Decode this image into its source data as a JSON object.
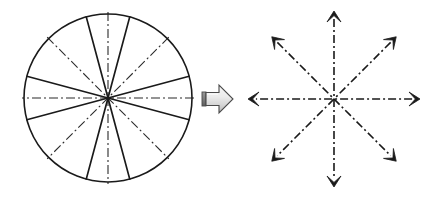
{
  "figure": {
    "caption": "",
    "width": 435,
    "height": 197,
    "background_color": "#ffffff"
  },
  "colors": {
    "stroke": "#1a1a1a",
    "circle_outline": "#1a1a1a",
    "solid_spoke": "#1a1a1a",
    "dashdot_axis": "#2b2b2b",
    "arrow_fill_light": "#efefef",
    "arrow_fill_mid": "#d0d0d0",
    "arrow_fill_dark": "#8a8a8a",
    "arrow_outline": "#4a4a4a",
    "arrow_cap": "#6e6e6e",
    "background": "#ffffff"
  },
  "left_panel": {
    "name": "sectored-circle",
    "label": "",
    "center": {
      "x": 108,
      "y": 98
    },
    "radius": 84,
    "sector_count": 12,
    "outline_width": 1.6,
    "solid_spokes": {
      "count": 8,
      "label": "",
      "stroke_width": 1.7,
      "angles_deg": [
        15,
        75,
        105,
        165,
        195,
        255,
        285,
        345
      ]
    },
    "dashdot_axes": {
      "count": 4,
      "label": "",
      "stroke_width": 1.1,
      "dash_pattern": "9,3,2,3",
      "angles_deg": [
        0,
        45,
        90,
        135
      ],
      "overshoot": 2
    }
  },
  "transform_arrow": {
    "name": "block-arrow-right",
    "label": "",
    "direction": "right",
    "x": 202,
    "y": 85,
    "width": 31,
    "height": 28,
    "shaft_height": 13,
    "head_width": 14
  },
  "right_panel": {
    "name": "symmetry-axes-star",
    "label": "",
    "center": {
      "x": 334,
      "y": 99
    },
    "axis_count": 4,
    "arrowhead_count": 8,
    "stroke_width": 1.6,
    "dash_pattern": "8,3,2,3",
    "arrowhead": {
      "length": 11,
      "half_width": 7
    },
    "axes": [
      {
        "name": "horizontal-axis",
        "angle_deg": 0,
        "radius": 86
      },
      {
        "name": "diagonal-axis-45",
        "angle_deg": 45,
        "radius": 88
      },
      {
        "name": "vertical-axis",
        "angle_deg": 90,
        "radius": 88
      },
      {
        "name": "diagonal-axis-135",
        "angle_deg": 135,
        "radius": 88
      }
    ]
  }
}
